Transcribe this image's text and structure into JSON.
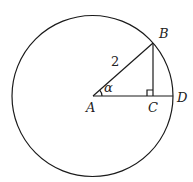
{
  "diagram": {
    "type": "geometry",
    "points": {
      "A": "A",
      "B": "B",
      "C": "C",
      "D": "D"
    },
    "labels": {
      "radius": "2",
      "angle": "α"
    },
    "elements": [
      "circle centered at A",
      "segment AB (radius)",
      "segment AD (radius along horizontal)",
      "segment BC perpendicular to AD",
      "right-angle marker at C",
      "angle arc at A"
    ]
  }
}
